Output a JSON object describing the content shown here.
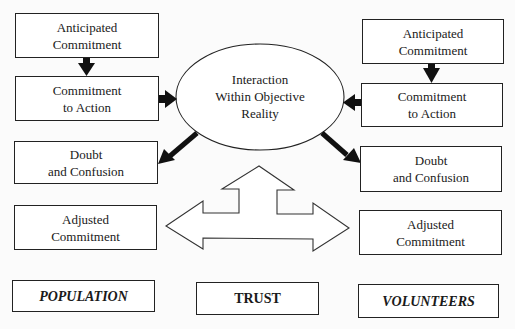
{
  "diagram": {
    "center": {
      "lines": [
        "Interaction",
        "Within Objective",
        "Reality"
      ]
    },
    "left_column": {
      "anticipated": [
        "Anticipated",
        "Commitment"
      ],
      "action": [
        "Commitment",
        "to Action"
      ],
      "doubt": [
        "Doubt",
        "and Confusion"
      ],
      "adjusted": [
        "Adjusted",
        "Commitment"
      ],
      "label": "POPULATION"
    },
    "right_column": {
      "anticipated": [
        "Anticipated",
        "Commitment"
      ],
      "action": [
        "Commitment",
        "to Action"
      ],
      "doubt": [
        "Doubt",
        "and Confusion"
      ],
      "adjusted": [
        "Adjusted",
        "Commitment"
      ],
      "label": "VOLUNTEERS"
    },
    "bottom_center_label": "TRUST",
    "connections": [
      {
        "from": "left.anticipated",
        "to": "left.action",
        "style": "solid-arrow"
      },
      {
        "from": "right.anticipated",
        "to": "right.action",
        "style": "solid-arrow"
      },
      {
        "from": "left.action",
        "to": "center",
        "style": "solid-arrow"
      },
      {
        "from": "right.action",
        "to": "center",
        "style": "solid-arrow"
      },
      {
        "from": "center",
        "to": "left.doubt",
        "style": "solid-arrow"
      },
      {
        "from": "center",
        "to": "right.doubt",
        "style": "solid-arrow"
      },
      {
        "from": "trust-arrow",
        "to": [
          "left.adjusted",
          "right.adjusted",
          "center"
        ],
        "style": "outline-three-way-arrow"
      }
    ],
    "colors": {
      "stroke": "#222222",
      "fill": "#ffffff",
      "background": "#fbfbfb"
    }
  }
}
